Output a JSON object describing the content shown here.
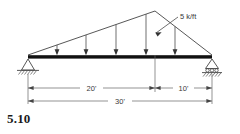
{
  "figure": {
    "problem_number": "5.10",
    "load_label": "5 k/ft",
    "dimensions": {
      "left_span": "20'",
      "right_span": "10'",
      "total_span": "30'"
    },
    "structure": {
      "type": "triangular-truss-beam",
      "apex_offset_ft": 20,
      "total_length_ft": 30,
      "left_support": "pin-support",
      "right_support": "roller-support",
      "load_type": "distributed-triangular",
      "load_magnitude": "5 k/ft",
      "load_arrow_count": 5
    },
    "colors": {
      "beam": "#111111",
      "line": "#444444",
      "text": "#3a3a3a",
      "number": "#1a1a1a",
      "background": "#ffffff"
    }
  }
}
